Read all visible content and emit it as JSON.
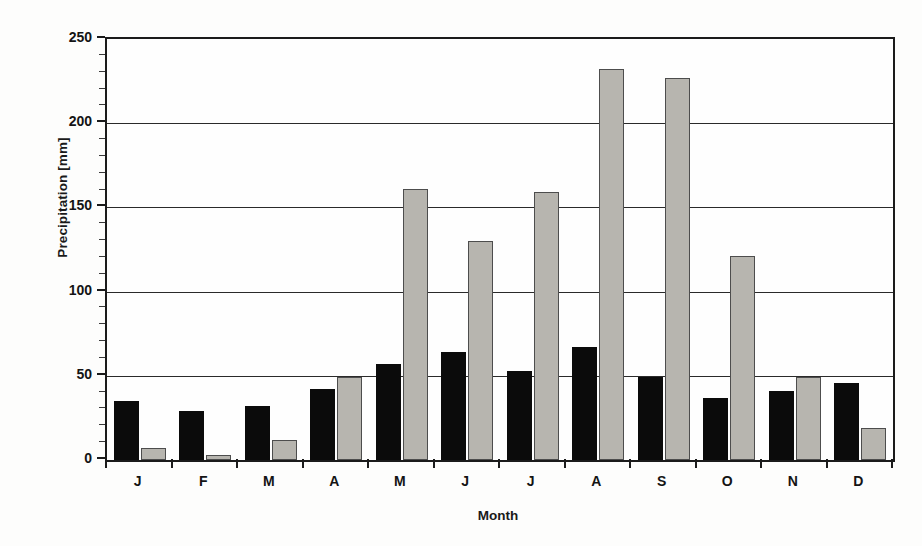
{
  "chart_data": {
    "type": "bar",
    "title": "",
    "subtitle": "",
    "xlabel": "Month",
    "ylabel": "Precipitation [mm]",
    "categories": [
      "J",
      "F",
      "M",
      "A",
      "M",
      "J",
      "J",
      "A",
      "S",
      "O",
      "N",
      "D"
    ],
    "category_names": [
      "January",
      "February",
      "March",
      "April",
      "May",
      "June",
      "July",
      "August",
      "September",
      "October",
      "November",
      "December"
    ],
    "series": [
      {
        "name": "series-1",
        "color": "#0b0b0b",
        "values": [
          35,
          29,
          32,
          42,
          57,
          64,
          53,
          67,
          49,
          37,
          41,
          46
        ]
      },
      {
        "name": "series-2",
        "color": "#b7b5af",
        "values": [
          7,
          3,
          12,
          49,
          161,
          130,
          159,
          232,
          227,
          121,
          49,
          19
        ]
      }
    ],
    "ylim": [
      0,
      250
    ],
    "yticks": [
      0,
      50,
      100,
      150,
      200,
      250
    ],
    "ytick_labels": [
      "0",
      "50",
      "100",
      "150",
      "200",
      "250"
    ],
    "grid": true,
    "grid_axis": "y",
    "legend": "none",
    "legend_position": "none",
    "plot_bgcolor": "#fefefe",
    "axis_color": "#1b1b1b",
    "grid_color": "#2a2a2a"
  }
}
